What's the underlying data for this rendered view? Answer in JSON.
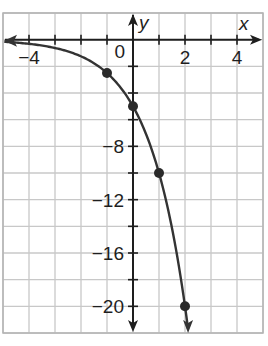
{
  "chart_data": {
    "type": "line",
    "title": "",
    "xlabel": "x",
    "ylabel": "y",
    "xlim": [
      -5,
      5
    ],
    "ylim": [
      -22,
      2
    ],
    "grid": true,
    "x_grid_step": 1,
    "y_grid_step": 2,
    "x_tick_labels": [
      {
        "value": -4,
        "label": "−4"
      },
      {
        "value": 0,
        "label": "0"
      },
      {
        "value": 2,
        "label": "2"
      },
      {
        "value": 4,
        "label": "4"
      }
    ],
    "y_tick_labels": [
      {
        "value": -8,
        "label": "−8"
      },
      {
        "value": -12,
        "label": "−12"
      },
      {
        "value": -16,
        "label": "−16"
      },
      {
        "value": -20,
        "label": "−20"
      }
    ],
    "series": [
      {
        "name": "curve",
        "equation_shape": "exponential y = -5 * 2^x",
        "points": [
          {
            "x": -1,
            "y": -2.5
          },
          {
            "x": 0,
            "y": -5
          },
          {
            "x": 1,
            "y": -10
          },
          {
            "x": 2,
            "y": -20
          }
        ],
        "left_asymptote": 0,
        "arrows": [
          "left",
          "down"
        ]
      }
    ]
  },
  "colors": {
    "grid": "#c8c8c8",
    "axis": "#1e1e1e",
    "curve": "#333333",
    "point": "#2a2a2a",
    "border": "#b4b4b4"
  }
}
